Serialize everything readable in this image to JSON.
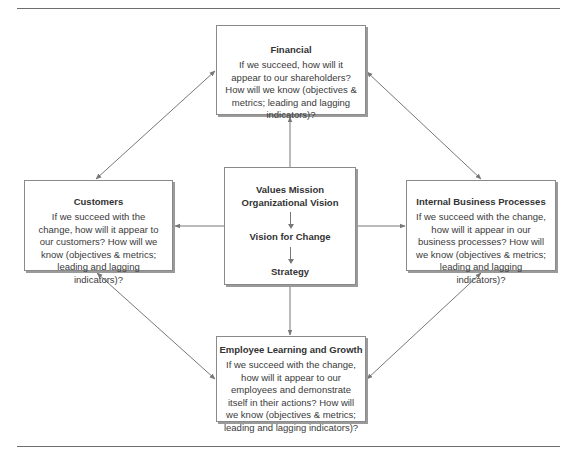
{
  "diagram": {
    "type": "balanced-scorecard",
    "boxes": {
      "financial": {
        "title": "Financial",
        "body": "If we succeed, how will it appear to our shareholders?  How will we know (objectives & metrics; leading and lagging indicators)?"
      },
      "customers": {
        "title": "Customers",
        "body": "If we succeed with the change, how will it appear to our customers? How will we know (objectives & metrics; leading and lagging indicators)?"
      },
      "internal": {
        "title": "Internal Business Processes",
        "body": "If we succeed with the change, how will it appear in our business processes?  How will we know (objectives & metrics; leading and lagging indicators)?"
      },
      "employee": {
        "title": "Employee Learning and Growth",
        "body": "If we succeed with the change, how will it appear to our employees and demonstrate itself in their actions?  How will we know (objectives & metrics; leading and lagging indicators)?"
      },
      "center": {
        "items": [
          "Values Mission Organizational Vision",
          "Vision for Change",
          "Strategy"
        ]
      }
    },
    "colors": {
      "line": "#777777",
      "box_border": "#8a8a8a",
      "shadow": "#9a9a9a",
      "text": "#333333"
    }
  }
}
